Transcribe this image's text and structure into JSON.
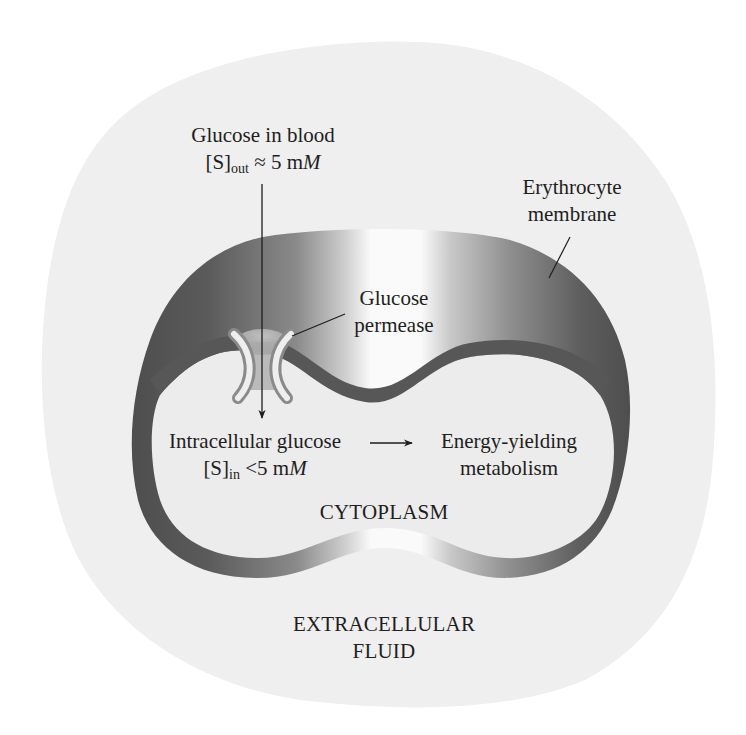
{
  "figure": {
    "type": "diagram",
    "colors": {
      "extracellular_blob": "#efefef",
      "membrane_dark": "#585858",
      "membrane_highlight": "#f8f8f8",
      "cytoplasm": "#ececec",
      "permease": "#d2d2d2",
      "text": "#1e1e1e"
    }
  },
  "labels": {
    "glucose_blood": {
      "line1": "Glucose in blood",
      "line2_prefix": "[S]",
      "line2_sub": "out",
      "line2_rel": " ≈ 5 m",
      "line2_unit": "M"
    },
    "membrane": {
      "line1": "Erythrocyte",
      "line2": "membrane"
    },
    "permease": {
      "line1": "Glucose",
      "line2": "permease"
    },
    "intracellular": {
      "line1": "Intracellular glucose",
      "line2_prefix": "[S]",
      "line2_sub": "in",
      "line2_rel": " <5 m",
      "line2_unit": "M"
    },
    "metabolism": {
      "line1": "Energy-yielding",
      "line2": "metabolism"
    },
    "cytoplasm": "CYTOPLASM",
    "extracellular": {
      "line1": "EXTRACELLULAR",
      "line2": "FLUID"
    }
  },
  "arrows": [
    {
      "name": "glucose-entry-arrow",
      "from": "Glucose in blood",
      "to": "Intracellular glucose",
      "direction": "down"
    },
    {
      "name": "metabolism-arrow",
      "from": "Intracellular glucose",
      "to": "Energy-yielding metabolism",
      "direction": "right"
    }
  ]
}
